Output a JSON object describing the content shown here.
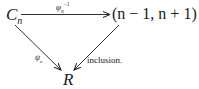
{
  "diagram": {
    "type": "commutative-triangle",
    "nodes": {
      "source": {
        "main": "C",
        "sub": "n"
      },
      "target_top": {
        "text": "(n − 1, n + 1)"
      },
      "bottom": {
        "main": "R"
      }
    },
    "arrows": {
      "top": {
        "label_main": "φ",
        "label_sub": "n",
        "label_sup": "−1",
        "from": "C_n",
        "to": "(n − 1, n + 1)"
      },
      "left": {
        "label_main": "ψ",
        "label_sub": "n",
        "from": "C_n",
        "to": "R"
      },
      "right": {
        "label": "inclusion.",
        "from": "(n − 1, n + 1)",
        "to": "R"
      }
    }
  }
}
